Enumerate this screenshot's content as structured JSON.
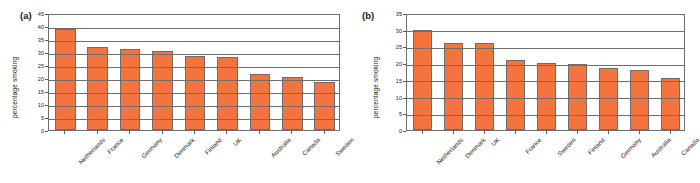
{
  "figure": {
    "panels": [
      {
        "label": "(a)",
        "ylabel": "percentage smoking"
      },
      {
        "label": "(b)",
        "ylabel": "percentage smoking"
      }
    ]
  },
  "chart_data": [
    {
      "type": "bar",
      "title": "(a)",
      "xlabel": "",
      "ylabel": "percentage smoking",
      "categories": [
        "Netherlands",
        "France",
        "Germany",
        "Denmark",
        "Finland",
        "UK",
        "Australia",
        "Canada",
        "Sweden"
      ],
      "values": [
        39,
        32,
        31,
        30.5,
        28.3,
        28,
        21.7,
        20.3,
        18.3
      ],
      "ylim": [
        0,
        45
      ],
      "yticks": [
        0,
        5,
        10,
        15,
        20,
        25,
        30,
        35,
        40,
        45
      ],
      "grid": true,
      "legend": false,
      "bar_color": "#F4733F",
      "bar_edge_color": "#6d6d6d"
    },
    {
      "type": "bar",
      "title": "(b)",
      "xlabel": "",
      "ylabel": "percentage smoking",
      "categories": [
        "Netherlands",
        "Denmark",
        "UK",
        "France",
        "Sweden",
        "Finland",
        "Germany",
        "Australia",
        "Canada"
      ],
      "values": [
        30,
        26.1,
        26,
        21,
        20,
        19.8,
        18.5,
        18,
        15.6
      ],
      "ylim": [
        0,
        35
      ],
      "yticks": [
        0,
        5,
        10,
        15,
        20,
        25,
        30,
        35
      ],
      "grid": true,
      "legend": false,
      "bar_color": "#F4733F",
      "bar_edge_color": "#6d6d6d"
    }
  ]
}
